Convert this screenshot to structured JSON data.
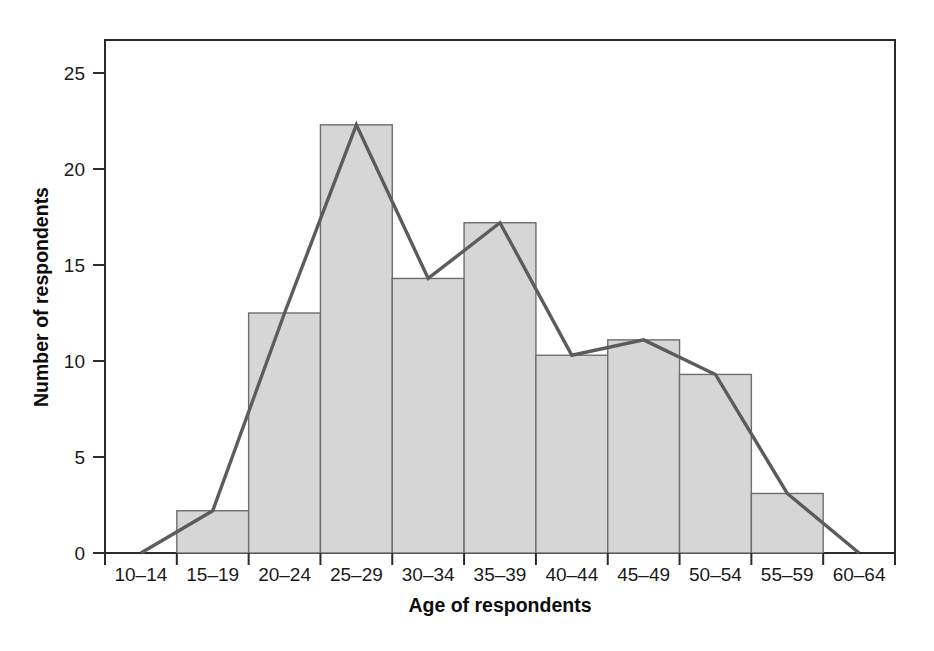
{
  "figure": {
    "name": "age-distribution-histogram",
    "background_color": "#ffffff"
  },
  "axes": {
    "x_title": "Age of respondents",
    "y_title": "Number of respondents",
    "y_ticks": [
      "0",
      "5",
      "10",
      "15",
      "20",
      "25"
    ],
    "x_ticks": [
      "10–14",
      "15–19",
      "20–24",
      "25–29",
      "30–34",
      "35–39",
      "40–44",
      "45–49",
      "50–54",
      "55–59",
      "60–64"
    ]
  },
  "style": {
    "bar_fill": "#d6d6d6",
    "bar_stroke": "#6e6e6e",
    "line_color": "#5c5c5c",
    "frame_color": "#2b2b2b",
    "text_color": "#1a1a1a"
  },
  "chart_data": {
    "type": "bar",
    "title": "",
    "subtitle": "",
    "xlabel": "Age of respondents",
    "ylabel": "Number of respondents",
    "categories": [
      "10–14",
      "15–19",
      "20–24",
      "25–29",
      "30–34",
      "35–39",
      "40–44",
      "45–49",
      "50–54",
      "55–59",
      "60–64"
    ],
    "values": [
      0,
      2.2,
      12.5,
      22.3,
      14.3,
      17.2,
      10.3,
      11.1,
      9.3,
      3.1,
      0
    ],
    "series": [
      {
        "name": "Histogram bars",
        "type": "bar",
        "values": [
          0,
          2.2,
          12.5,
          22.3,
          14.3,
          17.2,
          10.3,
          11.1,
          9.3,
          3.1,
          0
        ]
      },
      {
        "name": "Frequency polygon",
        "type": "line",
        "values": [
          0,
          2.2,
          12.5,
          22.3,
          14.3,
          17.2,
          10.3,
          11.1,
          9.3,
          3.1,
          0
        ]
      }
    ],
    "xlim": [
      0,
      11
    ],
    "ylim": [
      0,
      26.7
    ],
    "ytick_values": [
      0,
      5,
      10,
      15,
      20,
      25
    ],
    "grid": false,
    "legend": "none",
    "annotations": []
  }
}
